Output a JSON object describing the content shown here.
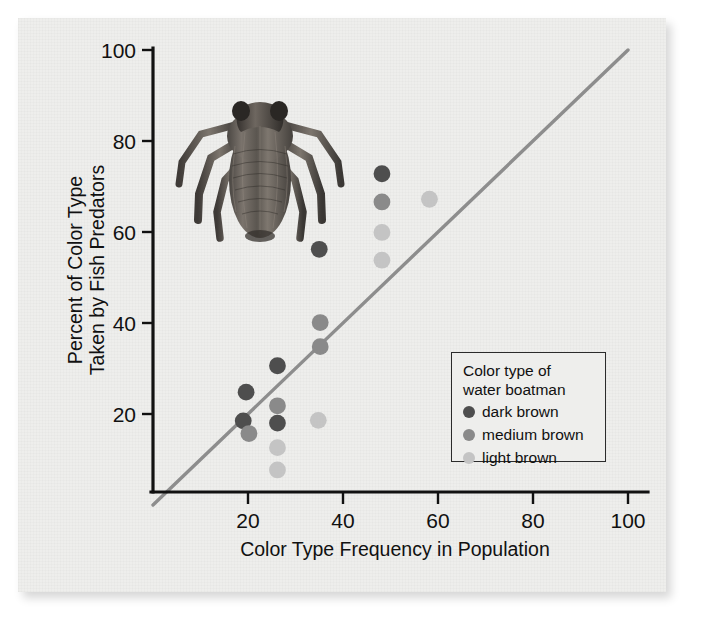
{
  "figure": {
    "caption_present": false,
    "illustration_name": "water-boatman-illustration"
  },
  "axes": {
    "x_title": "Color Type Frequency in Population",
    "y_title_line1": "Percent of Color Type",
    "y_title_line2": "Taken by Fish Predators",
    "x_ticks": [
      "20",
      "40",
      "60",
      "80",
      "100"
    ],
    "y_ticks": [
      "20",
      "40",
      "60",
      "80",
      "100"
    ]
  },
  "legend": {
    "title_line1": "Color type of",
    "title_line2": "water boatman",
    "entries": [
      {
        "label": "dark brown",
        "color": "#4e4e4e"
      },
      {
        "label": "medium brown",
        "color": "#8a8a8a"
      },
      {
        "label": "light brown",
        "color": "#c4c4c4"
      }
    ]
  },
  "colors": {
    "dark_brown": "#4e4e4e",
    "medium_brown": "#8a8a8a",
    "light_brown": "#c4c4c4",
    "reference_line": "#8d8d8d",
    "axis": "#111111",
    "paper": "#eeeeec",
    "page": "#ffffff"
  },
  "chart_data": {
    "type": "scatter",
    "title": "",
    "xlabel": "Color Type Frequency in Population",
    "ylabel": "Percent of Color Type Taken by Fish Predators",
    "xlim": [
      0,
      100
    ],
    "ylim": [
      0,
      100
    ],
    "xticks": [
      20,
      40,
      60,
      80,
      100
    ],
    "yticks": [
      20,
      40,
      60,
      80,
      100
    ],
    "grid": false,
    "legend_position": "inside-lower-right",
    "annotations": [
      {
        "kind": "reference-line",
        "description": "1:1 diagonal line of equal selection",
        "from": [
          0,
          0
        ],
        "to": [
          100,
          100
        ],
        "color": "#8d8d8d"
      },
      {
        "kind": "illustration",
        "description": "engraving of a water boatman insect",
        "position": "upper-left of plot area"
      }
    ],
    "series": [
      {
        "name": "dark brown",
        "color": "#4e4e4e",
        "points": [
          [
            19.0,
            18.5
          ],
          [
            19.6,
            24.8
          ],
          [
            26.2,
            18.0
          ],
          [
            26.2,
            30.6
          ],
          [
            35.0,
            56.2
          ],
          [
            48.2,
            72.8
          ]
        ]
      },
      {
        "name": "medium brown",
        "color": "#8a8a8a",
        "points": [
          [
            20.2,
            15.7
          ],
          [
            26.2,
            21.8
          ],
          [
            35.2,
            34.8
          ],
          [
            35.2,
            40.1
          ],
          [
            48.2,
            66.6
          ]
        ]
      },
      {
        "name": "light brown",
        "color": "#c4c4c4",
        "points": [
          [
            26.2,
            7.7
          ],
          [
            26.2,
            12.6
          ],
          [
            34.8,
            18.6
          ],
          [
            48.2,
            53.8
          ],
          [
            48.2,
            59.9
          ],
          [
            58.2,
            67.2
          ]
        ]
      }
    ]
  }
}
